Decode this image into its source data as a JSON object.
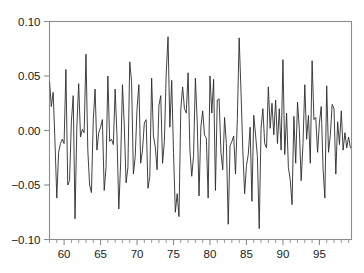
{
  "chart_data": {
    "type": "line",
    "title": "",
    "subtitle": "",
    "xlabel": "",
    "ylabel": "",
    "xlim": [
      58.0,
      99.4
    ],
    "ylim": [
      -0.1,
      0.1
    ],
    "grid": false,
    "legend": null,
    "legend_position": "none",
    "x_tick_labels": [
      "60",
      "65",
      "70",
      "75",
      "80",
      "85",
      "90",
      "95"
    ],
    "x_ticks": [
      60,
      65,
      70,
      75,
      80,
      85,
      90,
      95
    ],
    "x_minor_tick_step": 1,
    "y_tick_labels": [
      "0.10",
      "0.05",
      "0.00",
      "−0.05",
      "−0.10"
    ],
    "y_ticks": [
      0.1,
      0.05,
      0.0,
      -0.05,
      -0.1
    ],
    "line_color": "#2b2b2b",
    "axis_color": "#8c8c8c",
    "background_color": "#ffffff",
    "series": [
      {
        "name": "series-1",
        "x": [
          58.0,
          58.25,
          58.5,
          58.75,
          59.0,
          59.25,
          59.5,
          59.75,
          60.0,
          60.25,
          60.5,
          60.75,
          61.0,
          61.25,
          61.5,
          61.75,
          62.0,
          62.25,
          62.5,
          62.75,
          63.0,
          63.25,
          63.5,
          63.75,
          64.0,
          64.25,
          64.5,
          64.75,
          65.0,
          65.25,
          65.5,
          65.75,
          66.0,
          66.25,
          66.5,
          66.75,
          67.0,
          67.25,
          67.5,
          67.75,
          68.0,
          68.25,
          68.5,
          68.75,
          69.0,
          69.25,
          69.5,
          69.75,
          70.0,
          70.25,
          70.5,
          70.75,
          71.0,
          71.25,
          71.5,
          71.75,
          72.0,
          72.25,
          72.5,
          72.75,
          73.0,
          73.25,
          73.5,
          73.75,
          74.0,
          74.25,
          74.5,
          74.75,
          75.0,
          75.25,
          75.5,
          75.75,
          76.0,
          76.25,
          76.5,
          76.75,
          77.0,
          77.25,
          77.5,
          77.75,
          78.0,
          78.25,
          78.5,
          78.75,
          79.0,
          79.25,
          79.5,
          79.75,
          80.0,
          80.25,
          80.5,
          80.75,
          81.0,
          81.25,
          81.5,
          81.75,
          82.0,
          82.25,
          82.5,
          82.75,
          83.0,
          83.25,
          83.5,
          83.75,
          84.0,
          84.25,
          84.5,
          84.75,
          85.0,
          85.25,
          85.5,
          85.75,
          86.0,
          86.25,
          86.5,
          86.75,
          87.0,
          87.25,
          87.5,
          87.75,
          88.0,
          88.25,
          88.5,
          88.75,
          89.0,
          89.25,
          89.5,
          89.75,
          90.0,
          90.25,
          90.5,
          90.75,
          91.0,
          91.25,
          91.5,
          91.75,
          92.0,
          92.25,
          92.5,
          92.75,
          93.0,
          93.25,
          93.5,
          93.75,
          94.0,
          94.25,
          94.5,
          94.75,
          95.0,
          95.25,
          95.5,
          95.75,
          96.0,
          96.25,
          96.5,
          96.75,
          97.0,
          97.25,
          97.5,
          97.75,
          98.0,
          98.25,
          98.5,
          98.75,
          99.0,
          99.25
        ],
        "values": [
          0.045,
          0.022,
          0.035,
          -0.01,
          -0.062,
          -0.02,
          -0.012,
          -0.008,
          -0.012,
          0.056,
          -0.05,
          -0.046,
          0.008,
          0.032,
          -0.081,
          0.004,
          0.043,
          -0.006,
          0.001,
          -0.002,
          0.07,
          -0.018,
          -0.05,
          -0.057,
          0.01,
          0.038,
          -0.018,
          -0.002,
          0.003,
          0.01,
          -0.055,
          -0.034,
          0.05,
          -0.01,
          -0.008,
          -0.013,
          0.038,
          -0.005,
          -0.072,
          -0.03,
          0.042,
          0.005,
          -0.048,
          -0.034,
          0.063,
          0.045,
          -0.04,
          -0.024,
          0.02,
          0.042,
          -0.03,
          -0.018,
          0.007,
          0.01,
          -0.053,
          -0.042,
          0.048,
          -0.005,
          -0.015,
          -0.036,
          0.023,
          0.032,
          -0.03,
          -0.01,
          0.052,
          0.086,
          0.003,
          0.046,
          -0.02,
          -0.075,
          -0.058,
          -0.079,
          0.02,
          0.04,
          0.02,
          0.016,
          0.053,
          -0.018,
          -0.042,
          -0.023,
          0.048,
          0.008,
          -0.06,
          0.003,
          0.018,
          -0.004,
          -0.007,
          -0.062,
          0.05,
          0.016,
          0.047,
          -0.055,
          0.028,
          0.029,
          -0.02,
          -0.036,
          0.012,
          -0.012,
          -0.086,
          -0.014,
          -0.01,
          -0.005,
          -0.04,
          0.01,
          0.085,
          0.036,
          -0.018,
          -0.058,
          -0.032,
          -0.022,
          0.003,
          -0.065,
          0.014,
          -0.004,
          -0.024,
          -0.09,
          0.002,
          0.02,
          -0.012,
          -0.016,
          0.04,
          0.002,
          0.025,
          -0.004,
          0.028,
          -0.012,
          0.02,
          -0.018,
          0.065,
          -0.022,
          0.016,
          -0.034,
          -0.045,
          -0.068,
          0.013,
          -0.03,
          0.026,
          0.001,
          -0.046,
          -0.012,
          0.042,
          -0.008,
          0.014,
          -0.03,
          0.064,
          0.01,
          0.012,
          -0.02,
          0.007,
          0.022,
          -0.035,
          -0.062,
          0.041,
          -0.02,
          -0.004,
          0.024,
          0.02,
          -0.04,
          0.008,
          -0.013,
          0.018,
          -0.018,
          -0.002,
          -0.016,
          -0.006,
          -0.016
        ]
      }
    ]
  }
}
